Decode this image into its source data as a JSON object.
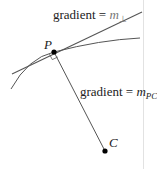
{
  "diagram": {
    "points": {
      "P": {
        "label": "P",
        "x": 54,
        "y": 52
      },
      "C": {
        "label": "C",
        "x": 105,
        "y": 151
      }
    },
    "labels": {
      "tangent_gradient": {
        "prefix": "gradient = ",
        "symbol": "m",
        "subscript": "⊥"
      },
      "radius_gradient": {
        "prefix": "gradient = ",
        "symbol": "m",
        "subscript": "PC"
      }
    },
    "colors": {
      "line": "#555555",
      "point": "#000000",
      "divider": "#dddddd"
    }
  }
}
